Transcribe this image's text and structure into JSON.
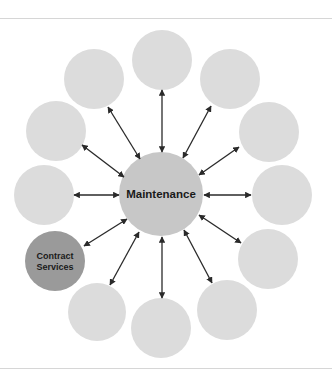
{
  "diagram": {
    "type": "hub-and-spoke",
    "colors": {
      "background": "#ffffff",
      "frame_line": "#d6d6d6",
      "hub_fill": "#c7c7c7",
      "satellite_fill": "#dcdcdc",
      "highlight_fill": "#9a9a9a",
      "arrow": "#2a2a2a",
      "label": "#1a1a1a"
    },
    "hub": {
      "label": "Maintenance",
      "cx": 161,
      "cy": 194,
      "r": 42
    },
    "satellites": [
      {
        "id": "top",
        "label": "",
        "cx": 162,
        "cy": 60,
        "r": 30,
        "highlight": false
      },
      {
        "id": "upper-right",
        "label": "",
        "cx": 230,
        "cy": 79,
        "r": 30,
        "highlight": false
      },
      {
        "id": "right-upper",
        "label": "",
        "cx": 269,
        "cy": 132,
        "r": 30,
        "highlight": false
      },
      {
        "id": "right",
        "label": "",
        "cx": 282,
        "cy": 195,
        "r": 30,
        "highlight": false
      },
      {
        "id": "right-lower",
        "label": "",
        "cx": 268,
        "cy": 259,
        "r": 30,
        "highlight": false
      },
      {
        "id": "lower-right",
        "label": "",
        "cx": 227,
        "cy": 310,
        "r": 30,
        "highlight": false
      },
      {
        "id": "bottom",
        "label": "",
        "cx": 161,
        "cy": 328,
        "r": 30,
        "highlight": false
      },
      {
        "id": "lower-left",
        "label": "",
        "cx": 97,
        "cy": 312,
        "r": 29,
        "highlight": false
      },
      {
        "id": "contract-services",
        "label": "Contract Services",
        "label_lines": [
          "Contract",
          "Services"
        ],
        "cx": 55,
        "cy": 261,
        "r": 30,
        "highlight": true
      },
      {
        "id": "left",
        "label": "",
        "cx": 44,
        "cy": 195,
        "r": 30,
        "highlight": false
      },
      {
        "id": "left-upper",
        "label": "",
        "cx": 56,
        "cy": 131,
        "r": 30,
        "highlight": false
      },
      {
        "id": "upper-left",
        "label": "",
        "cx": 94,
        "cy": 79,
        "r": 30,
        "highlight": false
      }
    ],
    "arrows": [
      {
        "to": "top",
        "x1": 162,
        "y1": 152,
        "x2": 162,
        "y2": 90
      },
      {
        "to": "upper-right",
        "x1": 183,
        "y1": 158,
        "x2": 211,
        "y2": 106
      },
      {
        "to": "right-upper",
        "x1": 199,
        "y1": 175,
        "x2": 239,
        "y2": 147
      },
      {
        "to": "right",
        "x1": 204,
        "y1": 195,
        "x2": 251,
        "y2": 195
      },
      {
        "to": "right-lower",
        "x1": 199,
        "y1": 215,
        "x2": 241,
        "y2": 243
      },
      {
        "to": "lower-right",
        "x1": 184,
        "y1": 230,
        "x2": 212,
        "y2": 283
      },
      {
        "to": "bottom",
        "x1": 162,
        "y1": 237,
        "x2": 162,
        "y2": 298
      },
      {
        "to": "lower-left",
        "x1": 139,
        "y1": 232,
        "x2": 110,
        "y2": 285
      },
      {
        "to": "contract-services",
        "x1": 127,
        "y1": 219,
        "x2": 84,
        "y2": 246
      },
      {
        "to": "left",
        "x1": 119,
        "y1": 195,
        "x2": 74,
        "y2": 195
      },
      {
        "to": "left-upper",
        "x1": 124,
        "y1": 177,
        "x2": 82,
        "y2": 145
      },
      {
        "to": "upper-left",
        "x1": 140,
        "y1": 159,
        "x2": 108,
        "y2": 107
      }
    ],
    "frame": {
      "top_line_y": 18,
      "bottom_line_y": 368
    }
  }
}
